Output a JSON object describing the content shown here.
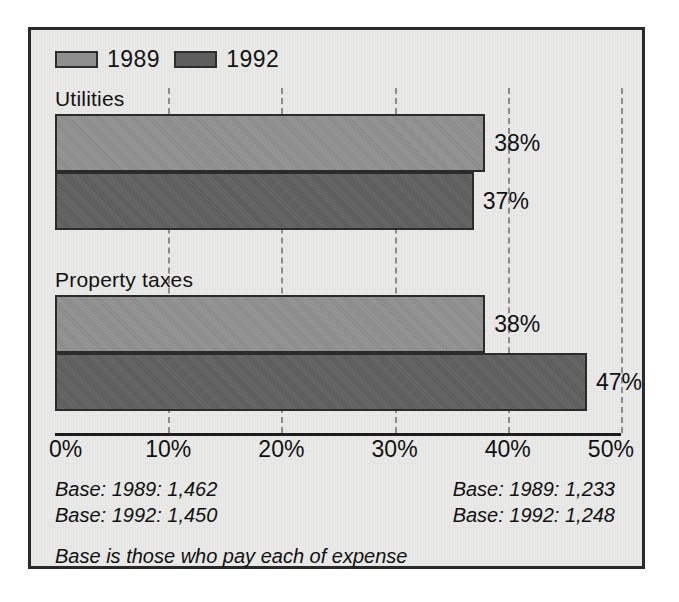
{
  "legend": {
    "entries": [
      {
        "label": "1989",
        "color": "#8f8f8f"
      },
      {
        "label": "1992",
        "color": "#5e5e5e"
      }
    ]
  },
  "axis": {
    "ticks": [
      "0%",
      "10%",
      "20%",
      "30%",
      "40%",
      "50%"
    ]
  },
  "groups": [
    {
      "title": "Utilities",
      "bars": [
        {
          "series": "1989",
          "value": 38,
          "label": "38%"
        },
        {
          "series": "1992",
          "value": 37,
          "label": "37%"
        }
      ]
    },
    {
      "title": "Property taxes",
      "bars": [
        {
          "series": "1989",
          "value": 38,
          "label": "38%"
        },
        {
          "series": "1992",
          "value": 47,
          "label": "47%"
        }
      ]
    }
  ],
  "notes": {
    "left": [
      "Base: 1989: 1,462",
      "Base: 1992: 1,450"
    ],
    "right": [
      "Base: 1989: 1,233",
      "Base: 1992: 1,248"
    ],
    "footer": "Base is those who pay each of expense"
  },
  "chart_data": {
    "type": "bar",
    "orientation": "horizontal",
    "title": "",
    "subtitle": "",
    "xlabel": "",
    "ylabel": "",
    "xlim": [
      0,
      50
    ],
    "xticks": [
      0,
      10,
      20,
      30,
      40,
      50
    ],
    "xtick_labels": [
      "0%",
      "10%",
      "20%",
      "30%",
      "40%",
      "50%"
    ],
    "grid": "vertical-dashed",
    "legend_position": "top-left",
    "categories": [
      "Utilities",
      "Property taxes"
    ],
    "series": [
      {
        "name": "1989",
        "color": "#8f8f8f",
        "values": [
          38,
          37
        ]
      },
      {
        "name": "1992",
        "color": "#5e5e5e",
        "values": [
          38,
          47
        ]
      }
    ],
    "data_labels": [
      [
        "38%",
        "37%"
      ],
      [
        "38%",
        "47%"
      ]
    ],
    "annotations": [
      "Base: 1989: 1,462",
      "Base: 1992: 1,450",
      "Base: 1989: 1,233",
      "Base: 1992: 1,248",
      "Base is those who pay each of expense"
    ]
  }
}
